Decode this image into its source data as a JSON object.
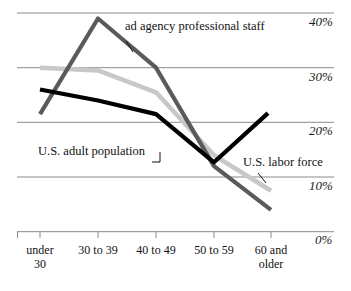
{
  "chart_data": {
    "type": "line",
    "title": "",
    "xlabel": "",
    "ylabel": "",
    "categories": [
      "under 30",
      "30 to 39",
      "40 to 49",
      "50 to 59",
      "60 and older"
    ],
    "ylim": [
      0,
      40
    ],
    "yticks": [
      0,
      10,
      20,
      30,
      40
    ],
    "ytick_labels": [
      "0%",
      "10%",
      "20%",
      "30%",
      "40%"
    ],
    "grid": true,
    "legend": "inline-annotations",
    "series": [
      {
        "name": "ad agency professional staff",
        "color": "#5a5a5a",
        "values": [
          21.5,
          39.0,
          30.0,
          12.0,
          4.0
        ]
      },
      {
        "name": "U.S. labor force",
        "color": "#c8c8c8",
        "values": [
          30.0,
          29.5,
          25.5,
          14.0,
          7.5
        ]
      },
      {
        "name": "U.S. adult population",
        "color": "#000000",
        "values": [
          26.0,
          24.0,
          21.5,
          12.7,
          21.7
        ]
      }
    ],
    "annotations": [
      {
        "label": "ad agency professional staff",
        "series": "ad agency professional staff"
      },
      {
        "label": "U.S. adult population",
        "series": "U.S. adult population"
      },
      {
        "label": "U.S. labor force",
        "series": "U.S. labor force"
      }
    ]
  },
  "axis": {
    "y_labels": [
      "40%",
      "30%",
      "20%",
      "10%",
      "0%"
    ],
    "x_labels": [
      {
        "line1": "under",
        "line2": "30"
      },
      {
        "line1": "30 to 39",
        "line2": ""
      },
      {
        "line1": "40 to 49",
        "line2": ""
      },
      {
        "line1": "50 to 59",
        "line2": ""
      },
      {
        "line1": "60 and",
        "line2": "older"
      }
    ]
  },
  "colors": {
    "grid": "#8a8a8a",
    "axis": "#8a8a8a",
    "ad_agency": "#5a5a5a",
    "labor_force": "#c8c8c8",
    "adult_population": "#000000",
    "text": "#111111",
    "background": "#ffffff"
  }
}
